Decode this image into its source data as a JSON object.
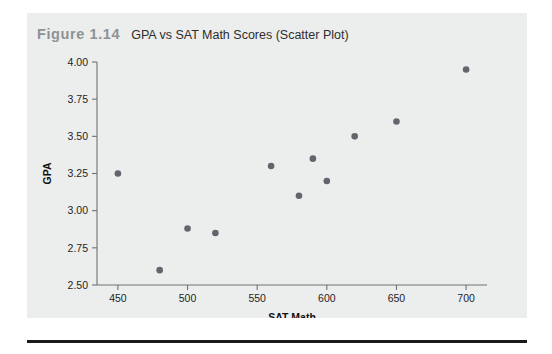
{
  "figure": {
    "number": "Figure 1.14",
    "title": "GPA vs SAT Math Scores (Scatter Plot)"
  },
  "colors": {
    "panel_background": "#eceded",
    "page_background": "#ffffff",
    "figure_number": "#8d9295",
    "point": "#61666c",
    "axis": "#6f7275",
    "rule": "#1b1b1b"
  },
  "chart_data": {
    "type": "scatter",
    "title": "GPA vs SAT Math Scores (Scatter Plot)",
    "xlabel": "SAT Math",
    "ylabel": "GPA",
    "xlim": [
      435,
      715
    ],
    "ylim": [
      2.5,
      4.0
    ],
    "xticks": [
      450,
      500,
      550,
      600,
      650,
      700
    ],
    "xtick_labels": [
      "450",
      "500",
      "550",
      "600",
      "650",
      "700"
    ],
    "yticks": [
      2.5,
      2.75,
      3.0,
      3.25,
      3.5,
      3.75,
      4.0
    ],
    "ytick_labels": [
      "2.50",
      "2.75",
      "3.00",
      "3.25",
      "3.50",
      "3.75",
      "4.00"
    ],
    "grid": false,
    "legend": false,
    "points": [
      {
        "x": 450,
        "y": 3.25
      },
      {
        "x": 480,
        "y": 2.6
      },
      {
        "x": 500,
        "y": 2.88
      },
      {
        "x": 520,
        "y": 2.85
      },
      {
        "x": 560,
        "y": 3.3
      },
      {
        "x": 580,
        "y": 3.1
      },
      {
        "x": 590,
        "y": 3.35
      },
      {
        "x": 600,
        "y": 3.2
      },
      {
        "x": 620,
        "y": 3.5
      },
      {
        "x": 650,
        "y": 3.6
      },
      {
        "x": 700,
        "y": 3.95
      }
    ]
  }
}
